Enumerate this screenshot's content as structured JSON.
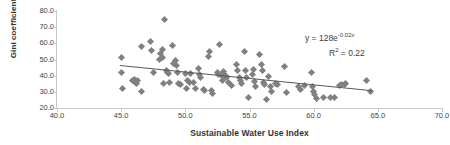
{
  "chart_data": {
    "type": "scatter",
    "title": "",
    "xlabel": "Sustainable Water Use Index",
    "ylabel": "Gini coefficient",
    "xlim": [
      40.0,
      70.0
    ],
    "ylim": [
      20.0,
      80.0
    ],
    "xticks": [
      "40.0",
      "45.0",
      "50.0",
      "55.0",
      "60.0",
      "65.0",
      "70.0"
    ],
    "yticks": [
      "80.0",
      "70.0",
      "60.0",
      "50.0",
      "40.0",
      "30.0",
      "20.0"
    ],
    "grid": false,
    "legend": "none",
    "marker_color": "#808080",
    "marker_shape": "diamond",
    "trendline": {
      "type": "exponential",
      "equation": "y = 128e",
      "exponent": "-0.02x",
      "r_squared_label": "R",
      "r_squared_sup": "2",
      "r_squared_value": " = 0.22",
      "color": "#595959",
      "x_start": 44.9,
      "y_start": 46.3,
      "x_end": 64.6,
      "y_end": 30.6
    },
    "points": [
      [
        45.0,
        51.5
      ],
      [
        45.0,
        42.2
      ],
      [
        45.1,
        31.8
      ],
      [
        45.9,
        36.8
      ],
      [
        46.0,
        37.4
      ],
      [
        46.1,
        36.0
      ],
      [
        46.2,
        35.3
      ],
      [
        46.3,
        37.2
      ],
      [
        46.6,
        58.0
      ],
      [
        46.6,
        30.4
      ],
      [
        47.3,
        61.3
      ],
      [
        47.4,
        55.8
      ],
      [
        47.5,
        41.8
      ],
      [
        48.0,
        49.8
      ],
      [
        48.1,
        53.5
      ],
      [
        48.2,
        51.0
      ],
      [
        48.2,
        56.2
      ],
      [
        48.3,
        35.0
      ],
      [
        48.4,
        74.7
      ],
      [
        48.5,
        43.5
      ],
      [
        48.6,
        42.0
      ],
      [
        48.7,
        41.5
      ],
      [
        48.8,
        36.0
      ],
      [
        49.0,
        58.4
      ],
      [
        49.1,
        47.3
      ],
      [
        49.2,
        49.5
      ],
      [
        49.3,
        46.0
      ],
      [
        49.4,
        42.0
      ],
      [
        49.5,
        35.4
      ],
      [
        49.6,
        34.8
      ],
      [
        50.0,
        41.3
      ],
      [
        50.1,
        32.3
      ],
      [
        50.2,
        37.2
      ],
      [
        50.3,
        36.0
      ],
      [
        50.4,
        41.5
      ],
      [
        50.6,
        35.6
      ],
      [
        50.8,
        32.2
      ],
      [
        51.0,
        44.3
      ],
      [
        51.1,
        41.0
      ],
      [
        51.2,
        38.6
      ],
      [
        51.4,
        31.2
      ],
      [
        51.5,
        31.0
      ],
      [
        51.8,
        52.0
      ],
      [
        51.9,
        55.2
      ],
      [
        52.0,
        30.6
      ],
      [
        52.1,
        29.2
      ],
      [
        52.5,
        42.0
      ],
      [
        52.6,
        41.0
      ],
      [
        52.7,
        59.2
      ],
      [
        52.8,
        39.8
      ],
      [
        52.9,
        37.0
      ],
      [
        53.0,
        42.5
      ],
      [
        53.1,
        40.2
      ],
      [
        53.2,
        38.7
      ],
      [
        53.4,
        35.5
      ],
      [
        53.6,
        33.8
      ],
      [
        54.0,
        47.2
      ],
      [
        54.1,
        43.0
      ],
      [
        54.2,
        39.0
      ],
      [
        54.3,
        37.2
      ],
      [
        54.4,
        35.0
      ],
      [
        54.6,
        55.0
      ],
      [
        54.7,
        43.0
      ],
      [
        54.8,
        38.6
      ],
      [
        54.9,
        26.3
      ],
      [
        55.2,
        41.0
      ],
      [
        55.3,
        43.6
      ],
      [
        55.4,
        36.2
      ],
      [
        55.5,
        33.0
      ],
      [
        55.8,
        52.8
      ],
      [
        55.9,
        47.0
      ],
      [
        56.0,
        43.3
      ],
      [
        56.1,
        36.0
      ],
      [
        56.2,
        34.4
      ],
      [
        56.3,
        25.2
      ],
      [
        56.5,
        39.4
      ],
      [
        56.6,
        33.4
      ],
      [
        56.7,
        30.2
      ],
      [
        57.0,
        35.4
      ],
      [
        57.2,
        34.6
      ],
      [
        57.7,
        45.6
      ],
      [
        57.9,
        29.5
      ],
      [
        58.8,
        33.4
      ],
      [
        59.0,
        31.2
      ],
      [
        59.3,
        34.0
      ],
      [
        59.8,
        41.8
      ],
      [
        59.9,
        33.4
      ],
      [
        60.0,
        30.0
      ],
      [
        60.1,
        28.3
      ],
      [
        60.2,
        25.6
      ],
      [
        60.8,
        26.5
      ],
      [
        61.3,
        26.4
      ],
      [
        61.6,
        26.3
      ],
      [
        62.0,
        33.8
      ],
      [
        62.2,
        34.8
      ],
      [
        62.4,
        34.4
      ],
      [
        62.5,
        35.0
      ],
      [
        64.1,
        37.2
      ],
      [
        64.4,
        30.4
      ]
    ]
  }
}
